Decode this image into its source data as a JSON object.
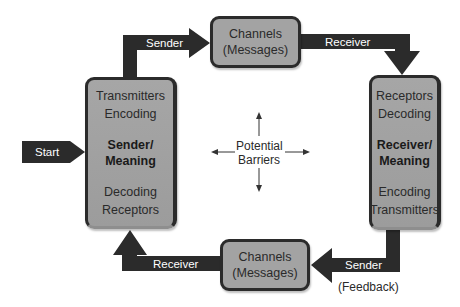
{
  "start": {
    "label": "Start"
  },
  "sender_box": {
    "lines_top": [
      "Transmitters",
      "Encoding"
    ],
    "title": [
      "Sender/",
      "Meaning"
    ],
    "lines_bottom": [
      "Decoding",
      "Receptors"
    ]
  },
  "receiver_box": {
    "lines_top": [
      "Receptors",
      "Decoding"
    ],
    "title": [
      "Receiver/",
      "Meaning"
    ],
    "lines_bottom": [
      "Encoding",
      "Transmitters"
    ]
  },
  "channels_top": {
    "lines": [
      "Channels",
      "(Messages)"
    ]
  },
  "channels_bottom": {
    "lines": [
      "Channels",
      "(Messages)"
    ]
  },
  "arrows": {
    "top_left": "Sender",
    "top_right": "Receiver",
    "bottom_right": "Sender",
    "bottom_right_note": "(Feedback)",
    "bottom_left": "Receiver"
  },
  "center": {
    "lines": [
      "Potential",
      "Barriers"
    ]
  },
  "colors": {
    "arrow": "#2b2b2b",
    "box_fill": "#a3a3a3",
    "box_border": "#2b2b2b"
  }
}
